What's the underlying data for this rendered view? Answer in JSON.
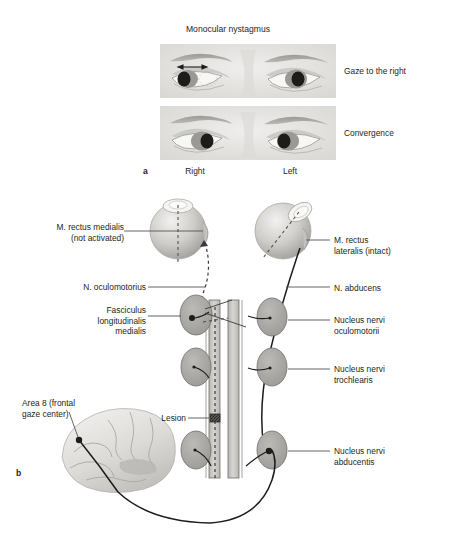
{
  "figure": {
    "panel_a": {
      "letter": "a",
      "title": "Monocular nystagmus",
      "row_labels": [
        "Gaze to the right",
        "Convergence"
      ],
      "eye_side_labels": [
        "Right",
        "Left"
      ],
      "rows": [
        {
          "name": "gaze-to-the-right",
          "arrow": "double-headed-horizontal-arrow"
        },
        {
          "name": "convergence",
          "arrow": "none"
        }
      ]
    },
    "panel_b": {
      "letter": "b",
      "labels": {
        "rectus_medialis": "M. rectus medialis\n(not activated)",
        "n_oculomotorius": "N. oculomotorius",
        "fasciculus": "Fasciculus\nlongitudinalis\nmedialis",
        "area8": "Area 8 (frontal\ngaze center)",
        "lesion": "Lesion",
        "rectus_lateralis": "M. rectus\nlateralis (intact)",
        "n_abducens": "N. abducens",
        "nucleus_oculomotorii": "Nucleus nervi\noculomotorii",
        "nucleus_trochlearis": "Nucleus nervi\ntrochlearis",
        "nucleus_abducentis": "Nucleus nervi\nabducentis"
      }
    }
  },
  "colors": {
    "ink": "#231f20",
    "photo_bg": "#e8e7e5",
    "nucleus_fill": "#a8a8a6",
    "nucleus_stroke": "#6e6e6c",
    "tract_fill": "#c9c9c6",
    "tract_stroke": "#6e6e6c",
    "eye_light": "#dedddb",
    "eye_mid": "#b9b8b5",
    "eye_dark": "#8e8d8a",
    "brain_light": "#ececea",
    "brain_mid": "#c9c8c5",
    "leader": "#555452",
    "lesion": "#3a3a38"
  }
}
